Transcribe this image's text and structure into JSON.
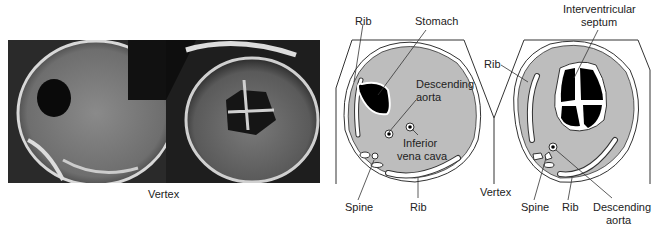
{
  "ultrasound": {
    "caption": "Vertex",
    "panels": [
      {
        "name": "abdominal-circumference-scan"
      },
      {
        "name": "four-chamber-heart-scan"
      }
    ]
  },
  "diagram_abdomen": {
    "labels": {
      "rib_top": "Rib",
      "stomach": "Stomach",
      "descending_aorta_1": "Descending",
      "descending_aorta_2": "aorta",
      "ivc_1": "Inferior",
      "ivc_2": "vena cava",
      "spine": "Spine",
      "rib_bottom": "Rib"
    }
  },
  "center": {
    "vertex": "Vertex"
  },
  "diagram_heart": {
    "labels": {
      "septum_1": "Interventricular",
      "septum_2": "septum",
      "rib_left": "Rib",
      "spine": "Spine",
      "rib_bottom": "Rib",
      "aorta_1": "Descending",
      "aorta_2": "aorta"
    }
  },
  "colors": {
    "tissue": "#b8b8b8",
    "outline": "#333333",
    "fluid": "#000000"
  }
}
